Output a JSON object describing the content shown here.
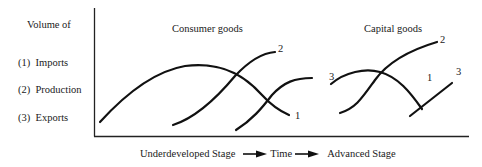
{
  "y_axis": {
    "title": "Volume of",
    "legend": [
      {
        "key": "(1)",
        "label": "Imports",
        "text": "(1)  Imports"
      },
      {
        "key": "(2)",
        "label": "Production",
        "text": "(2)  Production"
      },
      {
        "key": "(3)",
        "label": "Exports",
        "text": "(3)  Exports"
      }
    ]
  },
  "x_axis": {
    "start_label": "Underdeveloped Stage",
    "middle_label": "Time",
    "end_label": "Advanced Stage"
  },
  "panels": [
    {
      "title": "Consumer goods",
      "curves": [
        {
          "id": "1",
          "meaning": "Imports",
          "end_label": "1"
        },
        {
          "id": "2",
          "meaning": "Production",
          "end_label": "2"
        },
        {
          "id": "3",
          "meaning": "Exports",
          "end_label": "3"
        }
      ]
    },
    {
      "title": "Capital goods",
      "curves": [
        {
          "id": "1",
          "meaning": "Imports",
          "end_label": "1"
        },
        {
          "id": "2",
          "meaning": "Production",
          "end_label": "2"
        },
        {
          "id": "3",
          "meaning": "Exports",
          "end_label": "3"
        }
      ]
    }
  ],
  "style": {
    "line_color": "#111111",
    "background": "#ffffff"
  }
}
